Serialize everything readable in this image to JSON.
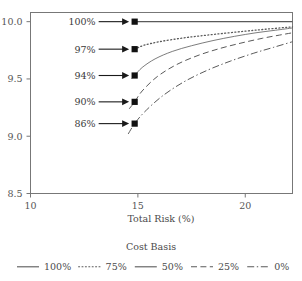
{
  "chart_data": {
    "type": "line",
    "title": "",
    "xlabel": "Total Risk (%)",
    "ylabel": "",
    "xlim": [
      10,
      22.2
    ],
    "ylim": [
      8.5,
      10.08
    ],
    "xticks": [
      10,
      15,
      20
    ],
    "xticklabels": [
      "10",
      "15",
      "20"
    ],
    "yticks": [
      8.5,
      9.0,
      9.5,
      10.0
    ],
    "yticklabels": [
      "8.5",
      "9.0",
      "9.5",
      "10.0"
    ],
    "grid": false,
    "legend": {
      "title": "Cost Basis",
      "position": "bottom",
      "entries": [
        {
          "label": "100%",
          "dash": "solid",
          "width": 1.1
        },
        {
          "label": "75%",
          "dash": "dotted",
          "width": 1.3
        },
        {
          "label": "50%",
          "dash": "solid",
          "width": 0.8
        },
        {
          "label": "25%",
          "dash": "dashed",
          "width": 1.0
        },
        {
          "label": "0%",
          "dash": "dashdot",
          "width": 1.0
        }
      ]
    },
    "series": [
      {
        "name": "100%",
        "dash": "solid",
        "x": [
          14.85,
          16.0,
          17.5,
          19.0,
          20.5,
          22.2
        ],
        "y": [
          10.0,
          10.0,
          10.0,
          10.0,
          10.0,
          10.0
        ]
      },
      {
        "name": "75%",
        "dash": "dotted",
        "x": [
          14.85,
          15.3,
          16.0,
          17.0,
          18.0,
          19.0,
          20.0,
          21.0,
          22.2
        ],
        "y": [
          9.76,
          9.795,
          9.825,
          9.855,
          9.878,
          9.898,
          9.917,
          9.935,
          9.955
        ]
      },
      {
        "name": "50%",
        "dash": "solid",
        "x": [
          14.7,
          14.85,
          15.2,
          15.8,
          16.6,
          17.5,
          18.5,
          19.5,
          20.5,
          21.4,
          22.2
        ],
        "y": [
          9.5,
          9.53,
          9.6,
          9.675,
          9.74,
          9.79,
          9.835,
          9.872,
          9.903,
          9.925,
          9.945
        ]
      },
      {
        "name": "25%",
        "dash": "dashed",
        "x": [
          14.6,
          14.85,
          15.2,
          15.9,
          16.8,
          17.8,
          18.8,
          19.8,
          20.8,
          21.6,
          22.2
        ],
        "y": [
          9.24,
          9.3,
          9.395,
          9.52,
          9.625,
          9.705,
          9.765,
          9.813,
          9.855,
          9.883,
          9.903
        ]
      },
      {
        "name": "0%",
        "dash": "dashdot",
        "x": [
          14.55,
          14.85,
          15.3,
          16.1,
          17.1,
          18.2,
          19.3,
          20.4,
          21.3,
          22.2
        ],
        "y": [
          9.02,
          9.11,
          9.21,
          9.345,
          9.47,
          9.573,
          9.655,
          9.725,
          9.775,
          9.825
        ]
      }
    ],
    "annotations": [
      {
        "label": "100%",
        "x": 14.85,
        "y": 10.0,
        "marker": "square"
      },
      {
        "label": "97%",
        "x": 14.85,
        "y": 9.76,
        "marker": "square"
      },
      {
        "label": "94%",
        "x": 14.85,
        "y": 9.53,
        "marker": "square"
      },
      {
        "label": "90%",
        "x": 14.85,
        "y": 9.3,
        "marker": "square"
      },
      {
        "label": "86%",
        "x": 14.85,
        "y": 9.11,
        "marker": "square"
      }
    ]
  },
  "colors": {
    "axis": "#777777",
    "text": "#4a4a4a",
    "marker": "#111111",
    "curve": "#5a5a5a"
  }
}
